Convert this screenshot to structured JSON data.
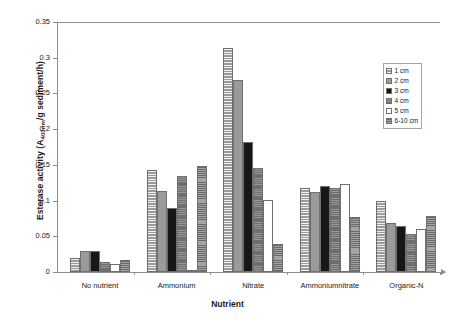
{
  "chart_data": {
    "type": "bar",
    "title": "",
    "xlabel": "Nutrient",
    "ylabel": "Esterase activity (A400nm/g sediment/h)",
    "ylabel_main": "Esterase activity (A",
    "ylabel_sub": "400nm",
    "ylabel_tail": "/g sediment/h)",
    "categories": [
      "No nutrient",
      "Ammonium",
      "Nitrate",
      "Ammoniumnitrate",
      "Organic-N"
    ],
    "ylim": [
      0,
      0.35
    ],
    "yticks": [
      "0",
      "0.05",
      "0.1",
      "0.15",
      "0.2",
      "0.25",
      "0.3",
      "0.35"
    ],
    "ytick_values": [
      0,
      0.05,
      0.1,
      0.15,
      0.2,
      0.25,
      0.3,
      0.35
    ],
    "grid": false,
    "legend_position": "upper right",
    "series": [
      {
        "name": "1 cm",
        "values": [
          0.02,
          0.143,
          0.314,
          0.117,
          0.099
        ]
      },
      {
        "name": "2 cm",
        "values": [
          0.029,
          0.113,
          0.269,
          0.112,
          0.068
        ]
      },
      {
        "name": "3 cm",
        "values": [
          0.03,
          0.09,
          0.182,
          0.121,
          0.064
        ]
      },
      {
        "name": "4 cm",
        "values": [
          0.014,
          0.135,
          0.146,
          0.118,
          0.053
        ]
      },
      {
        "name": "5 cm",
        "values": [
          0.011,
          0.002,
          0.101,
          0.123,
          0.06
        ]
      },
      {
        "name": "6-10 cm",
        "values": [
          0.017,
          0.148,
          0.039,
          0.077,
          0.078
        ]
      }
    ],
    "series_colors": [
      "#9b9b9b",
      "#9a9a9a",
      "#171717",
      "#6d6d6d",
      "#ffffff",
      "#878787"
    ]
  },
  "legend": {
    "items": [
      {
        "label": "1 cm"
      },
      {
        "label": "2 cm"
      },
      {
        "label": "3 cm"
      },
      {
        "label": "4 cm"
      },
      {
        "label": "5 cm"
      },
      {
        "label": "6-10 cm"
      }
    ]
  }
}
